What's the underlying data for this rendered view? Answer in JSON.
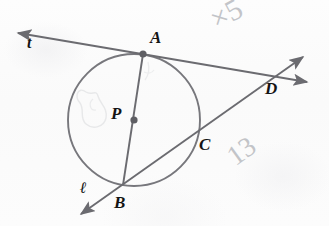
{
  "figure": {
    "background_color": "#fcfcfb",
    "ink_color": "#6b6b70",
    "label_color": "#141414",
    "pencil_color": "#b9bbc0",
    "width": 329,
    "height": 226
  },
  "circle": {
    "center_label": "P",
    "center": {
      "x": 134,
      "y": 120
    },
    "radius": 66,
    "stroke": "#77777c"
  },
  "points": [
    {
      "id": "A",
      "label": "A",
      "x": 143,
      "y": 54,
      "label_x": 150,
      "label_y": 29,
      "dot": true,
      "role": "tangent-point-on-circle"
    },
    {
      "id": "P",
      "label": "P",
      "x": 134,
      "y": 120,
      "label_x": 111,
      "label_y": 105,
      "dot": true,
      "role": "circle-center"
    },
    {
      "id": "B",
      "label": "B",
      "x": 123,
      "y": 185,
      "label_x": 114,
      "label_y": 194,
      "dot": false,
      "role": "point-on-circle"
    },
    {
      "id": "C",
      "label": "C",
      "x": 196,
      "y": 134,
      "label_x": 199,
      "label_y": 136,
      "dot": false,
      "role": "secant-intersection-on-circle"
    },
    {
      "id": "D",
      "label": "D",
      "x": 277,
      "y": 76,
      "label_x": 265,
      "label_y": 80,
      "dot": false,
      "role": "external-intersection-point"
    }
  ],
  "lines": [
    {
      "id": "t",
      "label": "t",
      "label_x": 27,
      "label_y": 35,
      "role": "tangent-line-through-A-and-D",
      "from": {
        "x": 18,
        "y": 33
      },
      "to": {
        "x": 307,
        "y": 82
      },
      "arrow_start": true,
      "arrow_end": true
    },
    {
      "id": "l",
      "label": "ℓ",
      "label_x": 80,
      "label_y": 180,
      "role": "secant-line-through-B-C-D",
      "from": {
        "x": 81,
        "y": 214
      },
      "to": {
        "x": 303,
        "y": 57
      },
      "arrow_start": true,
      "arrow_end": true
    },
    {
      "id": "AB",
      "label": "",
      "role": "diameter-segment-A-to-B",
      "from": {
        "x": 143,
        "y": 54
      },
      "to": {
        "x": 123,
        "y": 185
      },
      "arrow_start": false,
      "arrow_end": false
    }
  ],
  "pencil_marks": [
    {
      "id": "x5",
      "text": "×5",
      "x": 205,
      "y": 8,
      "rotation": -28,
      "font_size": 30
    },
    {
      "id": "13",
      "text": "13",
      "x": 222,
      "y": 148,
      "rotation": -36,
      "font_size": 28
    },
    {
      "id": "erased-scribble",
      "text": "○",
      "x": 79,
      "y": 86,
      "rotation": 12,
      "font_size": 26
    }
  ]
}
